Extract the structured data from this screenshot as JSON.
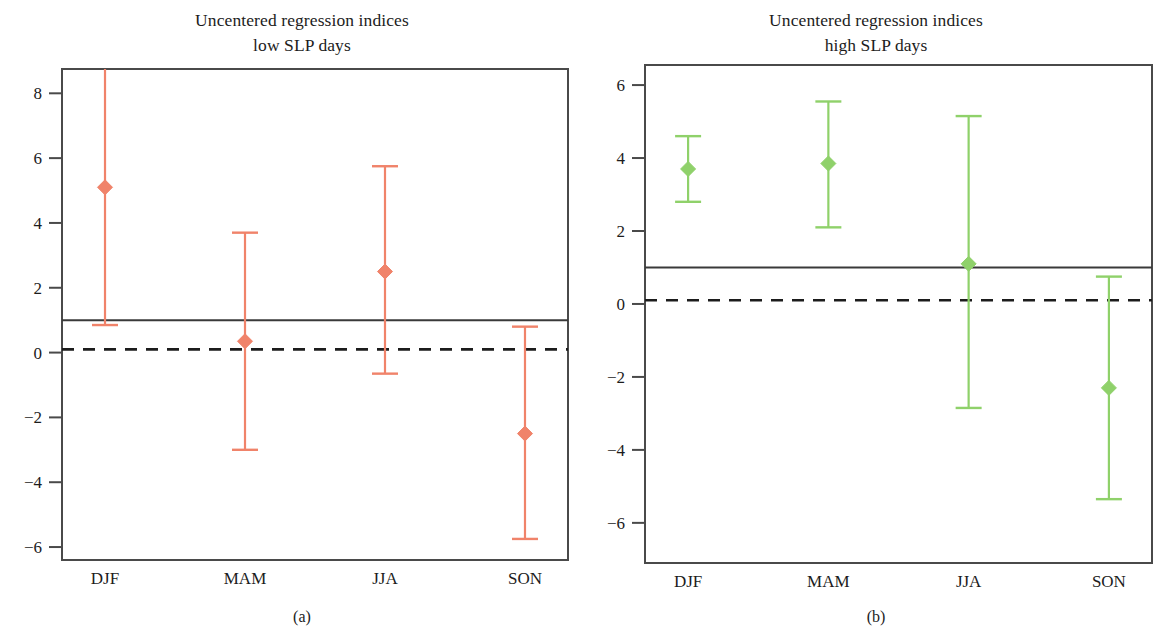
{
  "figure": {
    "panels": [
      {
        "id": "a",
        "caption": "(a)",
        "title_line1": "Uncentered regression indices",
        "title_line2": "low SLP days",
        "series_color": "#f0836a",
        "geometry": {
          "left": 62,
          "right": 568,
          "top": 69,
          "bottom": 560,
          "ymin": -6.4,
          "ymax": 8.75
        }
      },
      {
        "id": "b",
        "caption": "(b)",
        "title_line1": "Uncentered regression indices",
        "title_line2": "high SLP days",
        "series_color": "#8fd16a",
        "geometry": {
          "left": 645,
          "right": 1152,
          "top": 65,
          "bottom": 563,
          "ymin": -7.1,
          "ymax": 6.55
        }
      }
    ]
  },
  "chart_data": [
    {
      "type": "scatter",
      "panel": "a",
      "title": "Uncentered regression indices low SLP days",
      "subtitle": "low SLP days",
      "caption": "(a)",
      "xlabel": "",
      "ylabel": "",
      "categories": [
        "DJF",
        "MAM",
        "JJA",
        "SON"
      ],
      "yticks": [
        8,
        6,
        4,
        2,
        0,
        -2,
        -4,
        -6
      ],
      "ytick_labels": [
        "8",
        "6",
        "4",
        "2",
        "0",
        "−2",
        "−4",
        "−6"
      ],
      "ylim": [
        -6.4,
        8.75
      ],
      "grid": false,
      "legend": "none",
      "marker": "diamond",
      "color": "#f0836a",
      "series": [
        {
          "name": "low SLP days regression index",
          "values": [
            5.1,
            0.35,
            2.5,
            -2.5
          ],
          "ci_lower": [
            0.85,
            -3.0,
            -0.65,
            -5.75
          ],
          "ci_upper": [
            8.75,
            3.7,
            5.75,
            0.8
          ],
          "ci_upper_clipped": [
            true,
            false,
            false,
            false
          ]
        }
      ],
      "reference_lines": [
        {
          "value": 1.0,
          "style": "solid",
          "color": "#3a3a3a"
        },
        {
          "value": 0.1,
          "style": "dashed",
          "color": "#1c1c1c"
        }
      ]
    },
    {
      "type": "scatter",
      "panel": "b",
      "title": "Uncentered regression indices high SLP days",
      "subtitle": "high SLP days",
      "caption": "(b)",
      "xlabel": "",
      "ylabel": "",
      "categories": [
        "DJF",
        "MAM",
        "JJA",
        "SON"
      ],
      "yticks": [
        6,
        4,
        2,
        0,
        -2,
        -4,
        -6
      ],
      "ytick_labels": [
        "6",
        "4",
        "2",
        "0",
        "−2",
        "−4",
        "−6"
      ],
      "ylim": [
        -7.1,
        6.55
      ],
      "grid": false,
      "legend": "none",
      "marker": "diamond",
      "color": "#8fd16a",
      "series": [
        {
          "name": "high SLP days regression index",
          "values": [
            3.7,
            3.85,
            1.1,
            -2.3
          ],
          "ci_lower": [
            2.8,
            2.1,
            -2.85,
            -5.35
          ],
          "ci_upper": [
            4.6,
            5.55,
            5.15,
            0.75
          ],
          "ci_upper_clipped": [
            false,
            false,
            false,
            false
          ]
        }
      ],
      "reference_lines": [
        {
          "value": 1.0,
          "style": "solid",
          "color": "#3a3a3a"
        },
        {
          "value": 0.1,
          "style": "dashed",
          "color": "#1c1c1c"
        }
      ]
    }
  ]
}
